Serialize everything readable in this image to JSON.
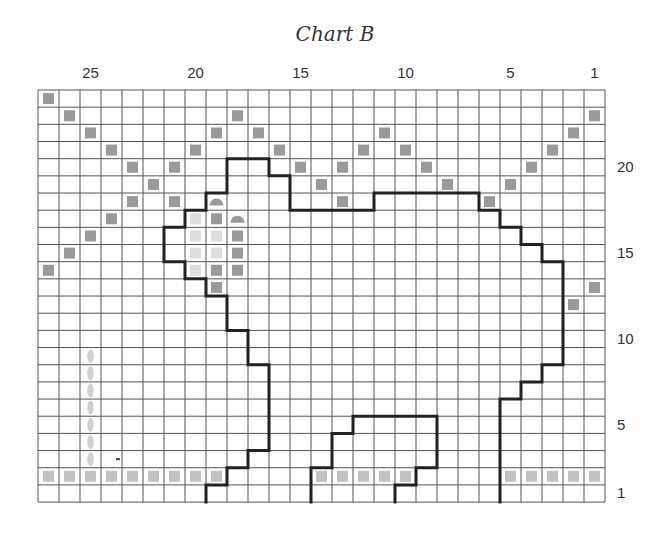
{
  "title": "Chart B",
  "grid": {
    "cols": 27,
    "rows": 24,
    "left": 38,
    "top": 90,
    "cell_w": 21,
    "cell_h": 17.17,
    "line_color": "#555555",
    "outline_color": "#222222"
  },
  "column_labels": [
    {
      "label": "25",
      "col": 25
    },
    {
      "label": "20",
      "col": 20
    },
    {
      "label": "15",
      "col": 15
    },
    {
      "label": "10",
      "col": 10
    },
    {
      "label": "5",
      "col": 5
    },
    {
      "label": "1",
      "col": 1
    }
  ],
  "row_labels": [
    {
      "label": "20",
      "row": 20
    },
    {
      "label": "15",
      "row": 15
    },
    {
      "label": "10",
      "row": 10
    },
    {
      "label": "5",
      "row": 5
    },
    {
      "label": "1",
      "row": 1
    }
  ],
  "colors": {
    "dark": "#9a9a9a",
    "light": "#c2c2c2",
    "pale": "#dedede",
    "oval": "#d0d0d0"
  },
  "symbols": {
    "dark_squares": [
      [
        0,
        0
      ],
      [
        1,
        1
      ],
      [
        1,
        9
      ],
      [
        2,
        2
      ],
      [
        2,
        8
      ],
      [
        2,
        10
      ],
      [
        3,
        3
      ],
      [
        3,
        7
      ],
      [
        3,
        11
      ],
      [
        4,
        4
      ],
      [
        4,
        6
      ],
      [
        4,
        12
      ],
      [
        5,
        5
      ],
      [
        5,
        13
      ],
      [
        6,
        4
      ],
      [
        6,
        6
      ],
      [
        7,
        3
      ],
      [
        7,
        8
      ],
      [
        8,
        2
      ],
      [
        8,
        9
      ],
      [
        9,
        1
      ],
      [
        9,
        9
      ],
      [
        10,
        0
      ],
      [
        10,
        8
      ],
      [
        10,
        9
      ],
      [
        11,
        8
      ],
      [
        1,
        26
      ],
      [
        2,
        16
      ],
      [
        2,
        25
      ],
      [
        3,
        15
      ],
      [
        3,
        17
      ],
      [
        3,
        24
      ],
      [
        4,
        14
      ],
      [
        4,
        18
      ],
      [
        4,
        23
      ],
      [
        5,
        19
      ],
      [
        5,
        22
      ],
      [
        6,
        14
      ],
      [
        6,
        21
      ],
      [
        11,
        26
      ],
      [
        12,
        25
      ]
    ],
    "light_squares": [
      [
        22,
        0
      ],
      [
        22,
        1
      ],
      [
        22,
        2
      ],
      [
        22,
        3
      ],
      [
        22,
        4
      ],
      [
        22,
        5
      ],
      [
        22,
        6
      ],
      [
        22,
        7
      ],
      [
        22,
        8
      ],
      [
        22,
        13
      ],
      [
        22,
        14
      ],
      [
        22,
        15
      ],
      [
        22,
        16
      ],
      [
        22,
        17
      ],
      [
        22,
        22
      ],
      [
        22,
        23
      ],
      [
        22,
        24
      ],
      [
        22,
        25
      ],
      [
        22,
        26
      ]
    ],
    "pale_squares": [
      [
        7,
        7
      ],
      [
        8,
        7
      ],
      [
        8,
        8
      ],
      [
        9,
        7
      ],
      [
        9,
        8
      ],
      [
        10,
        7
      ]
    ],
    "half_circles": [
      [
        6,
        8
      ],
      [
        7,
        9
      ]
    ],
    "ovals": [
      [
        15,
        2
      ],
      [
        16,
        2
      ],
      [
        17,
        2
      ],
      [
        18,
        2
      ],
      [
        19,
        2
      ],
      [
        20,
        2
      ],
      [
        21,
        2
      ]
    ],
    "dashes": [
      [
        21,
        3
      ]
    ]
  },
  "outlines": [
    {
      "name": "body-outline",
      "points": [
        [
          8,
          24
        ],
        [
          8,
          23
        ],
        [
          9,
          23
        ],
        [
          9,
          22
        ],
        [
          10,
          22
        ],
        [
          10,
          21
        ],
        [
          11,
          21
        ],
        [
          11,
          16
        ],
        [
          10,
          16
        ],
        [
          10,
          14
        ],
        [
          9,
          14
        ],
        [
          9,
          12
        ],
        [
          8,
          12
        ],
        [
          8,
          11
        ],
        [
          7,
          11
        ],
        [
          7,
          10
        ],
        [
          6,
          10
        ],
        [
          6,
          8
        ],
        [
          7,
          8
        ],
        [
          7,
          7
        ],
        [
          8,
          7
        ],
        [
          8,
          6
        ],
        [
          9,
          6
        ],
        [
          9,
          4
        ],
        [
          11,
          4
        ],
        [
          11,
          5
        ],
        [
          12,
          5
        ],
        [
          12,
          7
        ],
        [
          16,
          7
        ],
        [
          16,
          6
        ],
        [
          21,
          6
        ],
        [
          21,
          7
        ],
        [
          22,
          7
        ],
        [
          22,
          8
        ],
        [
          23,
          8
        ],
        [
          23,
          9
        ],
        [
          24,
          9
        ],
        [
          24,
          10
        ],
        [
          25,
          10
        ],
        [
          25,
          16
        ],
        [
          24,
          16
        ],
        [
          24,
          17
        ],
        [
          23,
          17
        ],
        [
          23,
          18
        ],
        [
          22,
          18
        ],
        [
          22,
          24
        ]
      ]
    },
    {
      "name": "leg-outline",
      "points": [
        [
          13,
          24
        ],
        [
          13,
          22
        ],
        [
          14,
          22
        ],
        [
          14,
          20
        ],
        [
          15,
          20
        ],
        [
          15,
          19
        ],
        [
          19,
          19
        ],
        [
          19,
          22
        ],
        [
          18,
          22
        ],
        [
          18,
          23
        ],
        [
          17,
          23
        ],
        [
          17,
          24
        ]
      ]
    }
  ]
}
